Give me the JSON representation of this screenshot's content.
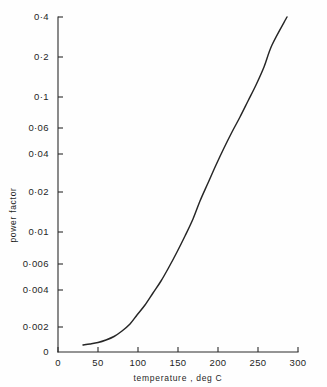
{
  "chart_data": {
    "type": "line",
    "title": "",
    "subtitle": "",
    "xlabel": "temperature , deg C",
    "ylabel": "power  factor",
    "xscale": "linear",
    "yscale": "log",
    "xlim": [
      0,
      300
    ],
    "ylim": [
      0.001,
      0.5
    ],
    "grid": false,
    "legend": null,
    "legend_position": "none",
    "xticks": [
      {
        "value": 0,
        "label": "0"
      },
      {
        "value": 50,
        "label": "50"
      },
      {
        "value": 100,
        "label": "100"
      },
      {
        "value": 150,
        "label": "150"
      },
      {
        "value": 200,
        "label": "200"
      },
      {
        "value": 250,
        "label": "250"
      },
      {
        "value": 300,
        "label": "300"
      }
    ],
    "yticks": [
      {
        "value": 0.4,
        "label": "0·4",
        "py": 17
      },
      {
        "value": 0.2,
        "label": "0·2",
        "py": 57
      },
      {
        "value": 0.1,
        "label": "0·1",
        "py": 97
      },
      {
        "value": 0.06,
        "label": "0·06",
        "py": 128
      },
      {
        "value": 0.04,
        "label": "0·04",
        "py": 154
      },
      {
        "value": 0.02,
        "label": "0·02",
        "py": 192
      },
      {
        "value": 0.01,
        "label": "0·01",
        "py": 232
      },
      {
        "value": 0.006,
        "label": "0·006",
        "py": 264
      },
      {
        "value": 0.004,
        "label": "0·004",
        "py": 290
      },
      {
        "value": 0.002,
        "label": "0·002",
        "py": 327
      },
      {
        "value": 0.0,
        "label": "0",
        "py": 352
      }
    ],
    "series": [
      {
        "name": "power factor vs temperature",
        "x": [
          32,
          40,
          50,
          60,
          70,
          80,
          90,
          100,
          110,
          120,
          130,
          140,
          150,
          160,
          170,
          180,
          190,
          200,
          210,
          220,
          230,
          240,
          250,
          260,
          270,
          278
        ],
        "y": [
          0.00112,
          0.00116,
          0.00122,
          0.00131,
          0.00145,
          0.00166,
          0.00196,
          0.00238,
          0.00295,
          0.0037,
          0.0047,
          0.0061,
          0.008,
          0.0107,
          0.0145,
          0.02,
          0.0275,
          0.0375,
          0.05,
          0.066,
          0.086,
          0.112,
          0.148,
          0.205,
          0.3,
          0.405
        ],
        "points_px": [
          [
            83,
            345
          ],
          [
            90,
            344
          ],
          [
            98,
            342.5
          ],
          [
            106,
            340
          ],
          [
            114,
            336.5
          ],
          [
            122,
            331
          ],
          [
            130,
            324
          ],
          [
            137,
            315
          ],
          [
            145,
            305
          ],
          [
            153,
            293
          ],
          [
            161,
            281
          ],
          [
            169,
            267
          ],
          [
            177,
            252
          ],
          [
            185,
            236
          ],
          [
            193,
            219
          ],
          [
            200,
            201
          ],
          [
            208,
            183
          ],
          [
            216,
            165
          ],
          [
            224,
            148
          ],
          [
            232,
            132
          ],
          [
            240,
            117
          ],
          [
            248,
            101
          ],
          [
            256,
            85
          ],
          [
            264,
            67
          ],
          [
            272,
            45
          ],
          [
            287,
            17
          ]
        ]
      }
    ]
  },
  "geometry": {
    "x_axis_y": 352,
    "y_axis_x": 58,
    "x_axis_x0": 58,
    "x_axis_x1": 298,
    "y_axis_y0": 17,
    "y_axis_y1": 352,
    "xtick_px": [
      58,
      98,
      138,
      178,
      218,
      258,
      298
    ],
    "xtick_label_y": 366,
    "ytick_label_x": 49,
    "xlabel_pos": [
      178,
      381
    ],
    "ylabel_pos": [
      16,
      215
    ]
  },
  "colors": {
    "background": "#ffffff",
    "ink": "#262626",
    "axis": "#2b2b2b"
  }
}
